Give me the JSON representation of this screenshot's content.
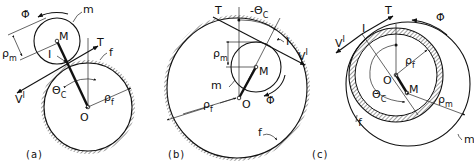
{
  "figure": {
    "panels": [
      {
        "id": "a",
        "caption": "(a)",
        "config": "moving circle outside fixed circle",
        "labels": {
          "phi_dot": "Φ̇",
          "m": "m",
          "rho_m": "ρ",
          "rho_m_sub": "m",
          "M": "M",
          "I": "I",
          "T": "T",
          "f": "f",
          "V": "V",
          "V_sup": "I",
          "theta": "Θ",
          "theta_sub": "C",
          "rho_f": "ρ",
          "rho_f_sub": "f",
          "O": "O"
        }
      },
      {
        "id": "b",
        "caption": "(b)",
        "config": "moving circle inside fixed circle",
        "labels": {
          "T": "T",
          "neg_theta": "-Θ",
          "theta_sub": "C",
          "I": "I",
          "V": "V",
          "V_sup": "I",
          "rho_m": "ρ",
          "rho_m_sub": "m",
          "M": "M",
          "m": "m",
          "O": "O",
          "phi_dot": "Φ̇",
          "rho_f": "ρ",
          "rho_f_sub": "f",
          "f": "f"
        }
      },
      {
        "id": "c",
        "caption": "(c)",
        "config": "fixed circle inside moving circle",
        "labels": {
          "T": "T",
          "phi_dot": "Φ̇",
          "I": "I",
          "V": "V",
          "V_sup": "I",
          "rho_f": "ρ",
          "rho_f_sub": "f",
          "O": "O",
          "M": "M",
          "theta": "Θ",
          "theta_sub": "C",
          "rho_m": "ρ",
          "rho_m_sub": "m",
          "f": "f",
          "m": "m"
        }
      }
    ]
  }
}
